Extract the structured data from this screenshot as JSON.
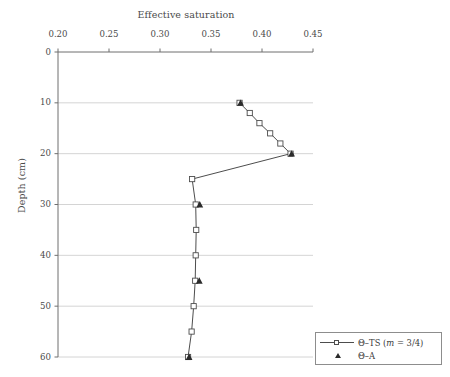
{
  "chart_data": {
    "type": "line",
    "title": "Effective saturation",
    "xlabel": "Effective saturation",
    "ylabel": "Depth (cm)",
    "xlim": [
      0.2,
      0.45
    ],
    "ylim": [
      0,
      60
    ],
    "y_inverted": true,
    "grid": "horizontal",
    "legend_position": "bottom-right",
    "xticks": [
      "0.20",
      "0.25",
      "0.30",
      "0.35",
      "0.40",
      "0.45"
    ],
    "xtick_values": [
      0.2,
      0.25,
      0.3,
      0.35,
      0.4,
      0.45
    ],
    "yticks": [
      "0",
      "10",
      "20",
      "30",
      "40",
      "50",
      "60"
    ],
    "ytick_values": [
      0,
      10,
      20,
      30,
      40,
      50,
      60
    ],
    "series": [
      {
        "name": "Θ–TS (m = 3/4)",
        "marker": "open-square",
        "line": true,
        "points": [
          {
            "x": 0.378,
            "depth": 10
          },
          {
            "x": 0.388,
            "depth": 12
          },
          {
            "x": 0.3975,
            "depth": 14
          },
          {
            "x": 0.408,
            "depth": 16
          },
          {
            "x": 0.418,
            "depth": 18
          },
          {
            "x": 0.428,
            "depth": 20
          },
          {
            "x": 0.3315,
            "depth": 25
          },
          {
            "x": 0.335,
            "depth": 30
          },
          {
            "x": 0.3355,
            "depth": 35
          },
          {
            "x": 0.335,
            "depth": 40
          },
          {
            "x": 0.3345,
            "depth": 45
          },
          {
            "x": 0.333,
            "depth": 50
          },
          {
            "x": 0.331,
            "depth": 55
          },
          {
            "x": 0.3275,
            "depth": 60
          }
        ]
      },
      {
        "name": "Θ–A",
        "marker": "filled-triangle",
        "line": false,
        "points": [
          {
            "x": 0.379,
            "depth": 10
          },
          {
            "x": 0.429,
            "depth": 20
          },
          {
            "x": 0.339,
            "depth": 30
          },
          {
            "x": 0.3385,
            "depth": 45
          },
          {
            "x": 0.3285,
            "depth": 60
          }
        ]
      }
    ]
  },
  "legend": {
    "items": [
      {
        "label_prefix": "Θ–TS (",
        "label_italic": "m",
        "label_suffix": " = 3/4)",
        "marker": "open-square-line"
      },
      {
        "label_prefix": "Θ–A",
        "label_italic": "",
        "label_suffix": "",
        "marker": "filled-triangle"
      }
    ]
  },
  "colors": {
    "axis": "#6f6f6f",
    "grid": "#c9c9c9",
    "line": "#4d4d4d",
    "marker_edge": "#4d4d4d",
    "marker_fill": "#ffffff",
    "triangle": "#2b2b2b",
    "text": "#4a4a4a",
    "background": "#ffffff"
  }
}
